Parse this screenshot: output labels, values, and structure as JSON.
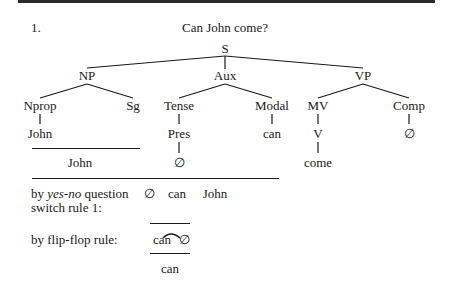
{
  "example": {
    "number": "1.",
    "title": "Can John come?"
  },
  "tree": {
    "root": "S",
    "level1": {
      "np": "NP",
      "aux": "Aux",
      "vp": "VP"
    },
    "level2": {
      "nprop": "Nprop",
      "sg": "Sg",
      "tense": "Tense",
      "modal": "Modal",
      "mv": "MV",
      "comp": "Comp"
    },
    "level3": {
      "john": "John",
      "pres": "Pres",
      "can": "can",
      "v": "V",
      "comp_null": "∅"
    },
    "level4": {
      "john": "John",
      "pres_null": "∅",
      "come": "come"
    }
  },
  "derivation": {
    "yes_no": {
      "label_prefix": "by ",
      "label_italic": "yes-no",
      "label_suffix": " question",
      "label_line2": "switch rule 1:",
      "output": [
        "∅",
        "can",
        "John"
      ]
    },
    "flip_flop": {
      "label": "by flip-flop rule:",
      "input_left": "can",
      "input_right": "∅",
      "output": "can"
    }
  }
}
